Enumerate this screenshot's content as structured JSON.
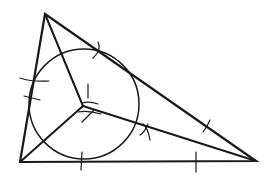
{
  "diagram": {
    "type": "triangle-incircle-construction",
    "stroke_color": "#1a1a1a",
    "background": "#ffffff",
    "vertices": {
      "A": [
        45,
        14
      ],
      "B": [
        20,
        162
      ],
      "C": [
        256,
        161
      ]
    },
    "incenter": [
      83,
      105
    ],
    "incircle": {
      "cx": 84,
      "cy": 104,
      "r": 55
    }
  }
}
